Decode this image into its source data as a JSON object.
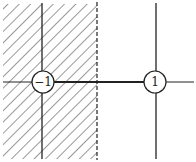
{
  "diagram": {
    "type": "complex-plane-branch-cut",
    "points": [
      {
        "label": "−1",
        "x": 43,
        "y": 82
      },
      {
        "label": "1",
        "x": 155,
        "y": 82
      }
    ],
    "dashed_boundary_x": 97,
    "hatched_region": "left of dashed line",
    "colors": {
      "line": "#222222",
      "background": "#ffffff"
    }
  }
}
